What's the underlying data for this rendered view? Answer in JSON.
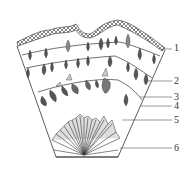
{
  "diagram": {
    "type": "cross-section schematic",
    "colors": {
      "line": "#333333",
      "fill_dark": "#555555",
      "fill_light": "#bbbbbb",
      "background": "#ffffff"
    },
    "labels": [
      {
        "id": "1",
        "text": "1",
        "y": 48
      },
      {
        "id": "2",
        "text": "2",
        "y": 81
      },
      {
        "id": "3",
        "text": "3",
        "y": 97
      },
      {
        "id": "4",
        "text": "4",
        "y": 106
      },
      {
        "id": "5",
        "text": "5",
        "y": 120
      },
      {
        "id": "6",
        "text": "6",
        "y": 148
      }
    ]
  }
}
